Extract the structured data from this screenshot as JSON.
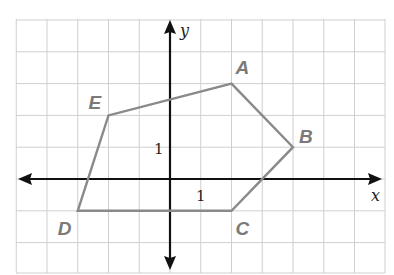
{
  "diagram": {
    "title": "",
    "axes": {
      "x_label": "x",
      "y_label": "y",
      "x_unit_label": "1",
      "y_unit_label": "1"
    },
    "grid": {
      "x_range": [
        -5,
        7
      ],
      "y_range": [
        -3,
        5
      ],
      "unit": 1
    },
    "polygon": {
      "name": "ABCDE",
      "vertices": [
        {
          "label": "A",
          "x": 2,
          "y": 3
        },
        {
          "label": "B",
          "x": 4,
          "y": 1
        },
        {
          "label": "C",
          "x": 2,
          "y": -1
        },
        {
          "label": "D",
          "x": -3,
          "y": -1
        },
        {
          "label": "E",
          "x": -2,
          "y": 2
        }
      ]
    },
    "colors": {
      "grid": "#cfcfcf",
      "axis": "#111111",
      "polygon": "#8a8a8a",
      "vertex_label": "#7a7a7a"
    }
  }
}
